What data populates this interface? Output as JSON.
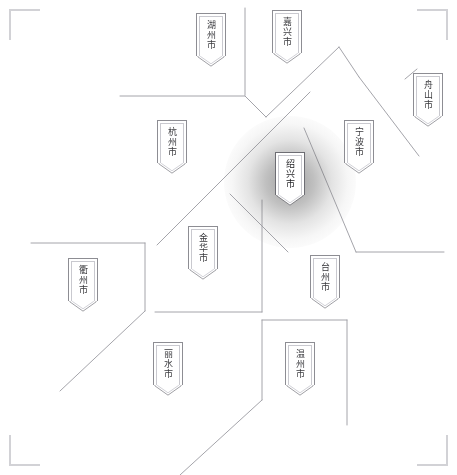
{
  "map": {
    "title": "浙江省城市分布示意图",
    "background_color": "#ffffff",
    "boundary_color": "#9a9aa0",
    "marker_border_color": "#8d8d93",
    "marker_inner_border_color": "#c9c9cf",
    "text_color": "#3a3a3e",
    "highlight_color": "#1d1d20",
    "width": 457,
    "height": 475
  },
  "corner_marks": [
    {
      "name": "top-left",
      "x": 10,
      "y": 10
    },
    {
      "name": "top-right",
      "x": 447,
      "y": 10
    },
    {
      "name": "bottom-left",
      "x": 10,
      "y": 465
    },
    {
      "name": "bottom-right",
      "x": 447,
      "y": 465
    }
  ],
  "cities": [
    {
      "id": "huzhou",
      "label": "湖州市",
      "x": 196,
      "y": 13,
      "highlight": false
    },
    {
      "id": "jiaxing",
      "label": "嘉兴市",
      "x": 272,
      "y": 10,
      "highlight": false
    },
    {
      "id": "zhoushan",
      "label": "舟山市",
      "x": 413,
      "y": 73,
      "highlight": false
    },
    {
      "id": "hangzhou",
      "label": "杭州市",
      "x": 157,
      "y": 120,
      "highlight": false
    },
    {
      "id": "ningbo",
      "label": "宁波市",
      "x": 344,
      "y": 120,
      "highlight": false
    },
    {
      "id": "shaoxing",
      "label": "绍兴市",
      "x": 275,
      "y": 152,
      "highlight": true
    },
    {
      "id": "jinhua",
      "label": "金华市",
      "x": 188,
      "y": 226,
      "highlight": false
    },
    {
      "id": "taizhou",
      "label": "台州市",
      "x": 310,
      "y": 255,
      "highlight": false
    },
    {
      "id": "quzhou",
      "label": "衢州市",
      "x": 68,
      "y": 258,
      "highlight": false
    },
    {
      "id": "lishui",
      "label": "丽水市",
      "x": 153,
      "y": 342,
      "highlight": false
    },
    {
      "id": "wenzhou",
      "label": "温州市",
      "x": 285,
      "y": 342,
      "highlight": false
    }
  ],
  "highlight_glow": {
    "center_x": 290,
    "center_y": 182,
    "radius": 66
  },
  "boundaries": [
    {
      "id": "huzhou-jiaxing-divider",
      "points": "245,8 245,95"
    },
    {
      "id": "huzhou-south-edge",
      "points": "120,96 245,96"
    },
    {
      "id": "huzhou-hangzhou-edge",
      "points": "245,96 266,117"
    },
    {
      "id": "jiaxing-shaoxing-edge",
      "points": "266,117 339,47"
    },
    {
      "id": "jiaxing-ningbo-edge",
      "points": "339,47 359,77"
    },
    {
      "id": "ningbo-zhoushan-edge",
      "points": "359,77 419,156"
    },
    {
      "id": "zhoushan-upper-edge",
      "points": "405,79 417,69"
    },
    {
      "id": "hangzhou-shaoxing-edge",
      "points": "157,245 310,92"
    },
    {
      "id": "shaoxing-jinhua-edge",
      "points": "230,194 288,252"
    },
    {
      "id": "shaoxing-ningbo-edge",
      "points": "304,128 356,252"
    },
    {
      "id": "ningbo-taizhou-edge",
      "points": "356,252 444,252"
    },
    {
      "id": "quzhou-north-edge",
      "points": "31,243 145,243"
    },
    {
      "id": "quzhou-east-edge",
      "points": "145,243 145,311"
    },
    {
      "id": "quzhou-southwest-edge",
      "points": "145,311 60,391"
    },
    {
      "id": "jinhua-south-edge",
      "points": "155,312 262,312"
    },
    {
      "id": "jinhua-taizhou-edge",
      "points": "262,312 262,200"
    },
    {
      "id": "lishui-wenzhou-edge",
      "points": "262,320 262,400"
    },
    {
      "id": "wenzhou-north-edge",
      "points": "262,320 347,320"
    },
    {
      "id": "wenzhou-east-edge",
      "points": "347,320 347,425"
    },
    {
      "id": "lishui-south-edge",
      "points": "262,400 180,475"
    }
  ]
}
